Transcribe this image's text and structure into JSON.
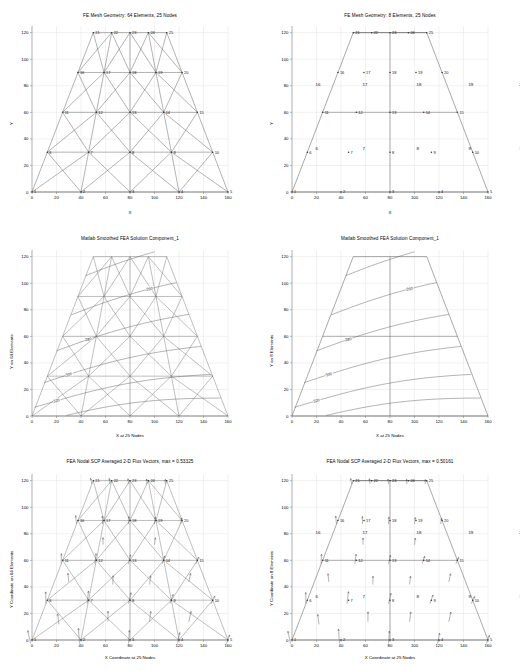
{
  "figure": {
    "width": 520,
    "height": 670,
    "background": "#ffffff",
    "line_color": "#555555",
    "grid_color": "#dcdcdc",
    "axis_color": "#8a8a8a",
    "text_color": "#000000"
  },
  "panels": [
    {
      "id": "mesh-64",
      "title": "FE Mesh Geometry: 64 Elements, 25 Nodes",
      "xlabel": "X",
      "ylabel": "Y",
      "xticks": [
        0,
        20,
        40,
        60,
        80,
        100,
        120,
        140,
        160
      ],
      "yticks": [
        0,
        20,
        40,
        60,
        80,
        100,
        120
      ],
      "xlim": [
        0,
        160
      ],
      "ylim": [
        0,
        125
      ],
      "show_nodes": true,
      "show_element_numbers": false,
      "mesh": "triangular-64"
    },
    {
      "id": "mesh-8",
      "title": "FE Mesh Geometry: 8 Elements, 25 Nodes",
      "xlabel": "X",
      "ylabel": "Y",
      "xticks": [
        0,
        20,
        40,
        60,
        80,
        100,
        120,
        140,
        160
      ],
      "yticks": [
        0,
        20,
        40,
        60,
        80,
        100,
        120
      ],
      "xlim": [
        0,
        160
      ],
      "ylim": [
        0,
        125
      ],
      "show_nodes": true,
      "show_element_numbers": false,
      "mesh": "quad-8"
    },
    {
      "id": "contour-64",
      "title": "Matlab Smoothed FEA Solution Component_1",
      "xlabel": "X at 25 Nodes",
      "ylabel": "Y on 64 Elements",
      "xticks": [
        0,
        20,
        40,
        60,
        80,
        100,
        120,
        140,
        160
      ],
      "yticks": [
        0,
        20,
        40,
        60,
        80,
        100,
        120
      ],
      "xlim": [
        0,
        160
      ],
      "ylim": [
        0,
        125
      ],
      "contour_levels": [
        240,
        260,
        280,
        300,
        320,
        340
      ]
    },
    {
      "id": "contour-8",
      "title": "Matlab Smoothed FEA Solution Component_1",
      "xlabel": "X at 25 Nodes",
      "ylabel": "Y on 8 Elements",
      "xticks": [
        0,
        20,
        40,
        60,
        80,
        100,
        120,
        140,
        160
      ],
      "yticks": [
        0,
        20,
        40,
        60,
        80,
        100,
        120
      ],
      "xlim": [
        0,
        160
      ],
      "ylim": [
        0,
        125
      ],
      "contour_levels": [
        220,
        240,
        260,
        280,
        300,
        320,
        340
      ]
    },
    {
      "id": "flux-64",
      "title": "FEA Nodal SCP Averaged 2-D Flux Vectors, max = 0.53325",
      "xlabel": "X Coordinate at 25 Nodes",
      "ylabel": "Y Coordinate on 64 Elements",
      "xticks": [
        0,
        20,
        40,
        60,
        80,
        100,
        120,
        140,
        160
      ],
      "yticks": [
        0,
        20,
        40,
        60,
        80,
        100,
        120
      ],
      "xlim": [
        0,
        160
      ],
      "ylim": [
        0,
        125
      ],
      "max_flux": "0.53325"
    },
    {
      "id": "flux-8",
      "title": "FEA Nodal SCP Averaged 2-D Flux Vectors, max = 0.50161",
      "xlabel": "X Coordinate at 25 Nodes",
      "ylabel": "Y Coordinate on 8 Elements",
      "xticks": [
        0,
        20,
        40,
        60,
        80,
        100,
        120,
        140,
        160
      ],
      "yticks": [
        0,
        20,
        40,
        60,
        80,
        100,
        120
      ],
      "xlim": [
        0,
        160
      ],
      "ylim": [
        0,
        125
      ],
      "max_flux": "0.50161"
    }
  ],
  "chart_data": {
    "type": "scatter",
    "xlabel": "X",
    "ylabel": "Y",
    "xlim": [
      0,
      160
    ],
    "ylim": [
      0,
      125
    ],
    "grid": true,
    "legend": "none",
    "node_labels": [
      "1",
      "2",
      "3",
      "4",
      "5",
      "6",
      "7",
      "8",
      "9",
      "10",
      "11",
      "12",
      "13",
      "14",
      "15",
      "16",
      "17",
      "18",
      "19",
      "20",
      "21",
      "22",
      "23",
      "24",
      "25"
    ],
    "nodes": [
      {
        "n": 1,
        "x": 0,
        "y": 0
      },
      {
        "n": 2,
        "x": 40,
        "y": 0
      },
      {
        "n": 3,
        "x": 80,
        "y": 0
      },
      {
        "n": 4,
        "x": 120,
        "y": 0
      },
      {
        "n": 5,
        "x": 160,
        "y": 0
      },
      {
        "n": 6,
        "x": 12.5,
        "y": 30
      },
      {
        "n": 7,
        "x": 46.2,
        "y": 30
      },
      {
        "n": 8,
        "x": 80,
        "y": 30
      },
      {
        "n": 9,
        "x": 113.8,
        "y": 30
      },
      {
        "n": 10,
        "x": 147.5,
        "y": 30
      },
      {
        "n": 11,
        "x": 25,
        "y": 60
      },
      {
        "n": 12,
        "x": 52.5,
        "y": 60
      },
      {
        "n": 13,
        "x": 80,
        "y": 60
      },
      {
        "n": 14,
        "x": 107.5,
        "y": 60
      },
      {
        "n": 15,
        "x": 135,
        "y": 60
      },
      {
        "n": 16,
        "x": 37.5,
        "y": 90
      },
      {
        "n": 17,
        "x": 58.8,
        "y": 90
      },
      {
        "n": 18,
        "x": 80,
        "y": 90
      },
      {
        "n": 19,
        "x": 101.2,
        "y": 90
      },
      {
        "n": 20,
        "x": 122.5,
        "y": 90
      },
      {
        "n": 21,
        "x": 50,
        "y": 120
      },
      {
        "n": 22,
        "x": 65,
        "y": 120
      },
      {
        "n": 23,
        "x": 80,
        "y": 120
      },
      {
        "n": 24,
        "x": 95,
        "y": 120
      },
      {
        "n": 25,
        "x": 110,
        "y": 120
      }
    ],
    "element_labels_8": [
      "6",
      "7",
      "8",
      "9",
      "10",
      "16",
      "17",
      "18",
      "19",
      "20"
    ],
    "contour_values_64": [
      240,
      260,
      280,
      300,
      320,
      340
    ],
    "contour_values_8": [
      220,
      240,
      260,
      280,
      300,
      320,
      340
    ],
    "flux_max_64": 0.53325,
    "flux_max_8": 0.50161,
    "flux_direction": "up-and-right, magnitude largest near lower-left edge"
  }
}
